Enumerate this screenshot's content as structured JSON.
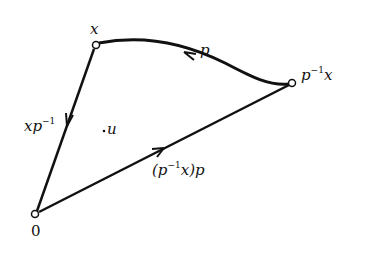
{
  "diagram": {
    "colors": {
      "stroke": "#111111",
      "background": "#ffffff"
    },
    "nodes": [
      {
        "id": "x",
        "label": "x",
        "pos": [
          96,
          45
        ]
      },
      {
        "id": "p_inv_x",
        "label_base": "p",
        "label_sup": "−1",
        "label_tail": "x",
        "pos": [
          292,
          83
        ]
      },
      {
        "id": "zero",
        "label": "0",
        "pos": [
          35,
          214
        ]
      }
    ],
    "edges": [
      {
        "from": "p_inv_x",
        "to": "x",
        "curved": true,
        "label": "p"
      },
      {
        "from": "x",
        "to": "zero",
        "label_base": "xp",
        "label_sup": "−1"
      },
      {
        "from": "zero",
        "to": "p_inv_x",
        "label_pre": "(p",
        "label_sup": "−1",
        "label_post": "x)p"
      }
    ],
    "point": {
      "label": "u",
      "dot": "·"
    }
  }
}
